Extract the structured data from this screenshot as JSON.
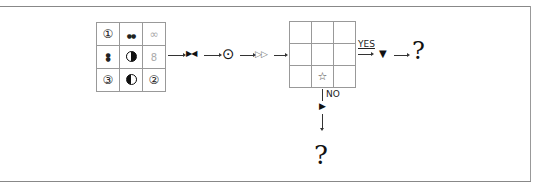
{
  "diagram": {
    "left_grid": {
      "rows": [
        [
          {
            "symbol": "①",
            "icon": "circled-one-icon"
          },
          {
            "symbol": "●●",
            "icon": "double-dot-horizontal-icon"
          },
          {
            "symbol": "∞",
            "icon": "double-circle-outline-icon"
          }
        ],
        [
          {
            "symbol": "⁝",
            "icon": "double-dot-vertical-icon"
          },
          {
            "symbol": "",
            "icon": "half-filled-circle-right-icon"
          },
          {
            "symbol": "8",
            "icon": "stacked-circles-outline-icon"
          }
        ],
        [
          {
            "symbol": "③",
            "icon": "circled-three-icon"
          },
          {
            "symbol": "",
            "icon": "half-filled-circle-left-icon"
          },
          {
            "symbol": "②",
            "icon": "circled-two-icon"
          }
        ]
      ]
    },
    "sequence": [
      {
        "symbol": "▶◀",
        "icon": "bowtie-icon"
      },
      {
        "symbol": "⊙",
        "icon": "circle-dot-icon"
      },
      {
        "symbol": "▷▷",
        "icon": "double-outline-triangle-icon"
      }
    ],
    "right_grid": {
      "rows": [
        [
          "",
          "",
          ""
        ],
        [
          "",
          "",
          ""
        ],
        [
          "",
          "☆",
          ""
        ]
      ]
    },
    "yes_branch": {
      "label": "YES",
      "symbol": "▼",
      "result": "?"
    },
    "no_branch": {
      "label": "NO",
      "symbol": "▶",
      "result": "?"
    }
  }
}
